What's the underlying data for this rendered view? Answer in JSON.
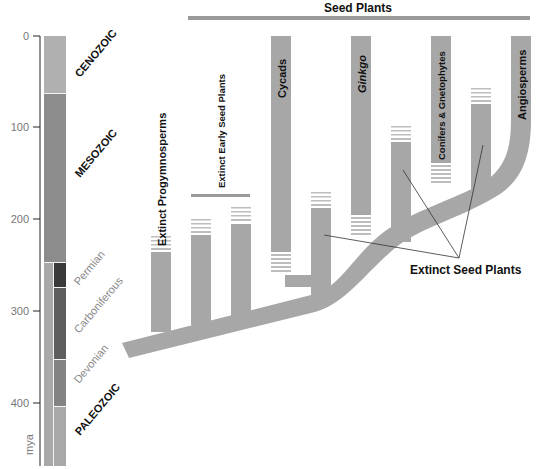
{
  "diagram": {
    "title": "Seed Plants",
    "axis": {
      "unit": "mya",
      "ticks": [
        "0",
        "100",
        "200",
        "300",
        "400"
      ]
    },
    "eras": {
      "cenozoic": "CENOZOIC",
      "mesozoic": "MESOZOIC",
      "paleozoic": "PALEOZOIC"
    },
    "periods": {
      "permian": "Permian",
      "carboniferous": "Carboniferous",
      "devonian": "Devonian"
    },
    "lineages": {
      "progymnosperms": "Extinct Progymnosperms",
      "early_seed_plants": "Extinct Early Seed Plants",
      "cycads": "Cycads",
      "ginkgo": "Ginkgo",
      "conifers": "Conifers & Gnetophytes",
      "angiosperms": "Angiosperms"
    },
    "callout": "Extinct Seed Plants",
    "colors": {
      "branch": "#a7a7a7",
      "cenozoic": "#b0b0b0",
      "mesozoic": "#8c8c8c",
      "paleozoic": "#a9a9a9",
      "permian": "#3a3a3a",
      "carboniferous": "#5e5e5e",
      "devonian": "#838383",
      "group_bar": "#9a9a9a"
    }
  }
}
